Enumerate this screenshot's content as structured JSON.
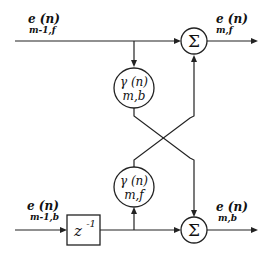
{
  "diagram": {
    "type": "lattice-filter-stage",
    "inputs": {
      "forward": {
        "main": "e (n)",
        "sub": "m-1,f"
      },
      "backward": {
        "main": "e (n)",
        "sub": "m-1,b"
      }
    },
    "outputs": {
      "forward": {
        "main": "e (n)",
        "sub": "m,f"
      },
      "backward": {
        "main": "e (n)",
        "sub": "m,b"
      }
    },
    "coefficients": {
      "backward": {
        "main": "γ (n)",
        "sub": "m,b"
      },
      "forward": {
        "main": "γ (n)",
        "sub": "m,f"
      }
    },
    "summers": {
      "top": "Σ",
      "bottom": "Σ"
    },
    "delay": {
      "base": "z",
      "exp": "-1"
    }
  }
}
